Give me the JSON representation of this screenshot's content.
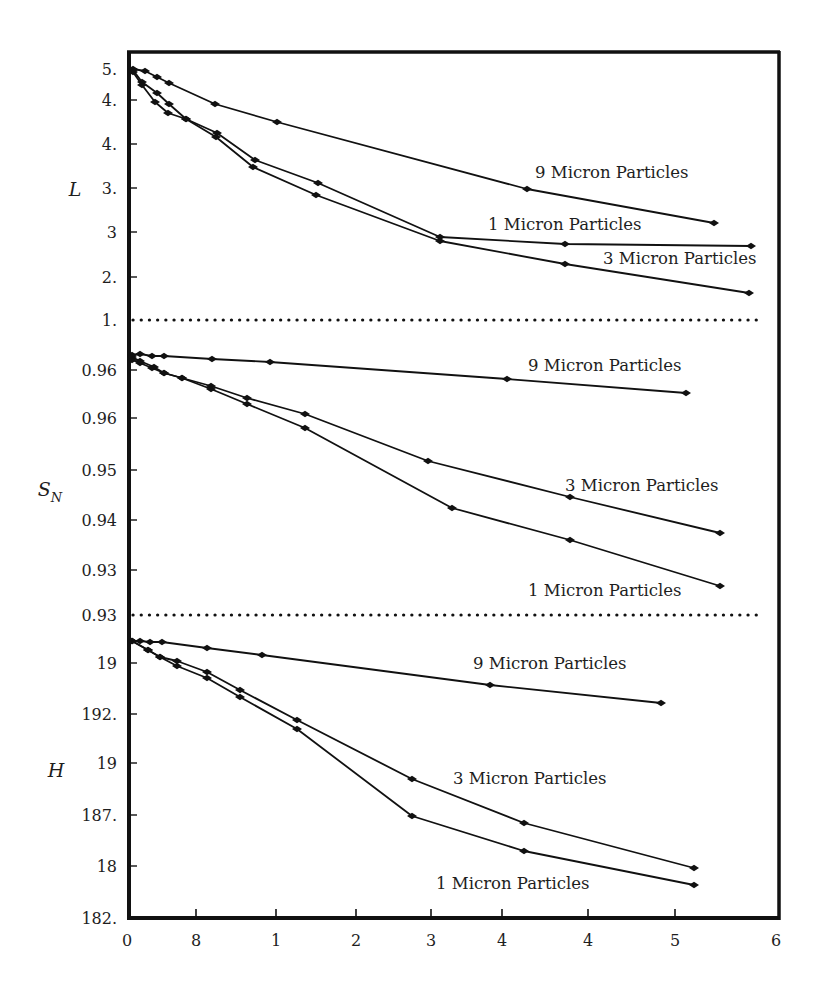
{
  "chart_data": {
    "type": "line",
    "title": "",
    "layout": "three stacked panels sharing one x-axis, separated by dotted lines",
    "xlabel": "",
    "x_tick_labels": [
      "0",
      "8",
      "1",
      "2",
      "3",
      "4",
      "4",
      "5",
      "6"
    ],
    "x_tick_positions_px": [
      127,
      196,
      276,
      356,
      431,
      502,
      588,
      675,
      776
    ],
    "grid": false,
    "legend": "inline text labels next to each series",
    "panels": [
      {
        "id": "L",
        "ylabel": "L",
        "y_tick_labels": [
          "5.",
          "4.",
          "4.",
          "3.",
          "3",
          "2.",
          "1."
        ],
        "y_tick_positions_px": [
          69,
          100,
          144,
          188,
          232,
          277,
          320
        ],
        "separator": "dotted line at bottom (tick 1.)",
        "series": [
          {
            "name": "9 Micron Particles",
            "points_px": [
              [
                133,
                69
              ],
              [
                145,
                71
              ],
              [
                157,
                77
              ],
              [
                169,
                83
              ],
              [
                215,
                104
              ],
              [
                277,
                122
              ],
              [
                527,
                189
              ],
              [
                714,
                223
              ]
            ],
            "label_pos_px": [
              535,
              178
            ]
          },
          {
            "name": "1 Micron Particles",
            "points_px": [
              [
                133,
                70
              ],
              [
                142,
                82
              ],
              [
                157,
                93
              ],
              [
                169,
                104
              ],
              [
                186,
                119
              ],
              [
                217,
                133
              ],
              [
                255,
                160
              ],
              [
                318,
                183
              ],
              [
                440,
                237
              ],
              [
                565,
                244
              ],
              [
                751,
                246
              ]
            ],
            "label_pos_px": [
              488,
              230
            ]
          },
          {
            "name": "3 Micron Particles",
            "points_px": [
              [
                133,
                72
              ],
              [
                142,
                85
              ],
              [
                155,
                102
              ],
              [
                168,
                113
              ],
              [
                186,
                119
              ],
              [
                216,
                137
              ],
              [
                253,
                167
              ],
              [
                316,
                195
              ],
              [
                440,
                241
              ],
              [
                565,
                264
              ],
              [
                749,
                293
              ]
            ],
            "label_pos_px": [
              603,
              264
            ]
          }
        ]
      },
      {
        "id": "SN",
        "ylabel": "S",
        "ylabel_sub": "N",
        "y_tick_labels": [
          "0.96",
          "0.96",
          "0.95",
          "0.94",
          "0.93",
          "0.93"
        ],
        "y_tick_positions_px": [
          370,
          418,
          470,
          520,
          570,
          615
        ],
        "separator": "dotted line at bottom (tick 0.93)",
        "series": [
          {
            "name": "9 Micron Particles",
            "points_px": [
              [
                132,
                355
              ],
              [
                140,
                354
              ],
              [
                152,
                356
              ],
              [
                164,
                356
              ],
              [
                212,
                359
              ],
              [
                270,
                362
              ],
              [
                507,
                379
              ],
              [
                686,
                393
              ]
            ],
            "label_pos_px": [
              528,
              371
            ]
          },
          {
            "name": "3 Micron Particles",
            "points_px": [
              [
                132,
                357
              ],
              [
                140,
                361
              ],
              [
                154,
                367
              ],
              [
                164,
                373
              ],
              [
                182,
                378
              ],
              [
                211,
                386
              ],
              [
                247,
                398
              ],
              [
                305,
                414
              ],
              [
                428,
                461
              ],
              [
                570,
                497
              ],
              [
                720,
                533
              ]
            ],
            "label_pos_px": [
              565,
              491
            ]
          },
          {
            "name": "1 Micron Particles",
            "points_px": [
              [
                132,
                360
              ],
              [
                140,
                363
              ],
              [
                152,
                368
              ],
              [
                164,
                373
              ],
              [
                182,
                378
              ],
              [
                211,
                389
              ],
              [
                247,
                404
              ],
              [
                305,
                428
              ],
              [
                452,
                508
              ],
              [
                570,
                540
              ],
              [
                720,
                586
              ]
            ],
            "label_pos_px": [
              528,
              596
            ]
          }
        ]
      },
      {
        "id": "H",
        "ylabel": "H",
        "y_tick_labels": [
          "19",
          "192.",
          "19",
          "187.",
          "18",
          "182."
        ],
        "y_tick_positions_px": [
          663,
          714,
          763,
          815,
          866,
          918
        ],
        "series": [
          {
            "name": "9 Micron Particles",
            "points_px": [
              [
                132,
                641
              ],
              [
                140,
                641
              ],
              [
                150,
                642
              ],
              [
                162,
                642
              ],
              [
                207,
                648
              ],
              [
                262,
                655
              ],
              [
                490,
                685
              ],
              [
                661,
                703
              ]
            ],
            "label_pos_px": [
              473,
              669
            ]
          },
          {
            "name": "3 Micron Particles",
            "points_px": [
              [
                132,
                641
              ],
              [
                148,
                650
              ],
              [
                160,
                657
              ],
              [
                177,
                661
              ],
              [
                207,
                672
              ],
              [
                240,
                690
              ],
              [
                297,
                720
              ],
              [
                412,
                779
              ],
              [
                524,
                823
              ],
              [
                694,
                868
              ]
            ],
            "label_pos_px": [
              453,
              784
            ]
          },
          {
            "name": "1 Micron Particles",
            "points_px": [
              [
                132,
                641
              ],
              [
                148,
                650
              ],
              [
                160,
                657
              ],
              [
                177,
                666
              ],
              [
                207,
                678
              ],
              [
                240,
                697
              ],
              [
                297,
                729
              ],
              [
                412,
                816
              ],
              [
                524,
                851
              ],
              [
                694,
                885
              ]
            ],
            "label_pos_px": [
              436,
              889
            ]
          }
        ]
      }
    ],
    "colors": {
      "line": "#111111",
      "marker": "#111111",
      "frame": "#111111",
      "background": "#ffffff"
    }
  }
}
